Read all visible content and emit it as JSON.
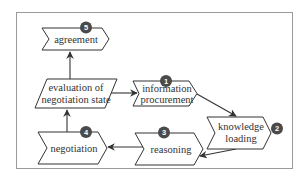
{
  "diagram": {
    "colors": {
      "border": "#9a9a9a",
      "shape_stroke": "#333333",
      "badge_fill": "#4a4a4a",
      "badge_text": "#ffffff",
      "arrow": "#333333"
    },
    "nodes": [
      {
        "id": "agreement",
        "step": "5",
        "lines": [
          "agreement"
        ]
      },
      {
        "id": "evaluation",
        "step": "",
        "lines": [
          "evaluation of",
          "negotiation state"
        ]
      },
      {
        "id": "information-procurement",
        "step": "1",
        "lines": [
          "information",
          "procurement"
        ]
      },
      {
        "id": "knowledge-loading",
        "step": "2",
        "lines": [
          "knowledge",
          "loading"
        ]
      },
      {
        "id": "reasoning",
        "step": "3",
        "lines": [
          "reasoning"
        ]
      },
      {
        "id": "negotiation",
        "step": "4",
        "lines": [
          "negotiation"
        ]
      }
    ],
    "edges": [
      {
        "from": "evaluation",
        "to": "agreement"
      },
      {
        "from": "evaluation",
        "to": "information-procurement"
      },
      {
        "from": "information-procurement",
        "to": "knowledge-loading"
      },
      {
        "from": "knowledge-loading",
        "to": "reasoning"
      },
      {
        "from": "reasoning",
        "to": "negotiation"
      },
      {
        "from": "negotiation",
        "to": "evaluation"
      }
    ]
  }
}
